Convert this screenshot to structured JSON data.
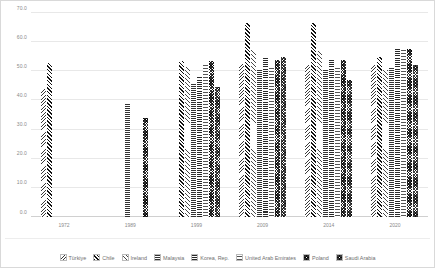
{
  "chart_data": {
    "type": "bar",
    "title": "",
    "xlabel": "",
    "ylabel": "",
    "ylim": [
      0.0,
      70.0
    ],
    "ytick_labels": [
      "70.0",
      "60.0",
      "50.0",
      "40.0",
      "30.0",
      "20.0",
      "10.0",
      "0.0"
    ],
    "ytick_values": [
      70.0,
      60.0,
      50.0,
      40.0,
      30.0,
      20.0,
      10.0,
      0.0
    ],
    "grid": true,
    "legend_position": "bottom",
    "categories": [
      "1972",
      "1989",
      "1999",
      "2009",
      "2014",
      "2020"
    ],
    "series": [
      {
        "name": "Türkiye",
        "pattern": "diag-fine-right",
        "values": [
          44.0,
          null,
          null,
          52.5,
          52.0,
          52.0
        ]
      },
      {
        "name": "Chile",
        "pattern": "diag-bold-left",
        "values": [
          53.0,
          null,
          53.5,
          66.5,
          66.5,
          55.0
        ]
      },
      {
        "name": "Ireland",
        "pattern": "diag-sparse",
        "values": [
          null,
          null,
          51.5,
          57.5,
          57.0,
          50.5
        ]
      },
      {
        "name": "Malaysia",
        "pattern": "horiz-fine",
        "values": [
          null,
          39.0,
          45.5,
          50.5,
          50.5,
          51.5
        ]
      },
      {
        "name": "Korea, Rep.",
        "pattern": "horiz-bold",
        "values": [
          null,
          null,
          48.0,
          55.0,
          54.0,
          57.5
        ]
      },
      {
        "name": "United Arab Emirates",
        "pattern": "horiz-dense",
        "values": [
          null,
          null,
          52.0,
          51.5,
          51.5,
          58.0
        ]
      },
      {
        "name": "Poland",
        "pattern": "crosshatch-a",
        "values": [
          null,
          34.0,
          53.5,
          54.0,
          54.0,
          57.5
        ]
      },
      {
        "name": "Saudi Arabia",
        "pattern": "crosshatch-b",
        "values": [
          null,
          null,
          44.5,
          55.0,
          47.0,
          52.0
        ]
      }
    ]
  },
  "axis": {
    "y_labels": [
      "70.0",
      "60.0",
      "50.0",
      "40.0",
      "30.0",
      "20.0",
      "10.0",
      "0.0"
    ],
    "x_labels": [
      "1972",
      "1989",
      "1999",
      "2009",
      "2014",
      "2020"
    ]
  },
  "legend": {
    "items": [
      {
        "label": "Türkiye"
      },
      {
        "label": "Chile"
      },
      {
        "label": "Ireland"
      },
      {
        "label": "Malaysia"
      },
      {
        "label": "Korea, Rep."
      },
      {
        "label": "United Arab Emirates"
      },
      {
        "label": "Poland"
      },
      {
        "label": "Saudi Arabia"
      }
    ]
  },
  "colors": {
    "grid": "#e8e8e8",
    "axis_text": "#8a8a8a",
    "legend_text": "#6f6f6f",
    "bar_ink": "#333333",
    "background": "#ffffff",
    "border": "#d9d9d9"
  }
}
